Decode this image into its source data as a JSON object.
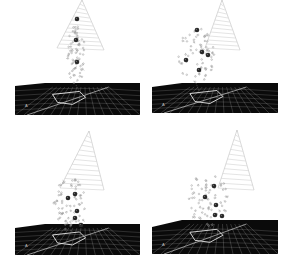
{
  "figure": {
    "layout": "2x2 grid",
    "panels": [
      {
        "id": "top-left",
        "ground": {
          "x": 15,
          "y": 83,
          "w": 125,
          "h": 32,
          "slant": 3
        },
        "cone": {
          "apexX": 82,
          "apexY": 0,
          "baseLX": 57,
          "baseRX": 104,
          "baseY": 48,
          "rings": 12
        },
        "dark_spheres": [
          [
            77,
            19
          ],
          [
            76,
            40
          ],
          [
            77,
            62
          ]
        ],
        "cluster": {
          "cx": 76,
          "cy": 55,
          "rx": 9,
          "ry": 30
        },
        "label": "A"
      },
      {
        "id": "top-right",
        "ground": {
          "x": 152,
          "y": 83,
          "w": 126,
          "h": 30,
          "slant": 4
        },
        "cone": {
          "apexX": 222,
          "apexY": 0,
          "baseLX": 205,
          "baseRX": 240,
          "baseY": 48,
          "rings": 12
        },
        "dark_spheres": [
          [
            197,
            30
          ],
          [
            202,
            52
          ],
          [
            208,
            55
          ],
          [
            186,
            60
          ],
          [
            199,
            70
          ]
        ],
        "cluster": {
          "cx": 196,
          "cy": 55,
          "rx": 18,
          "ry": 28
        },
        "label": "A"
      },
      {
        "id": "bottom-left",
        "ground": {
          "x": 15,
          "y": 224,
          "w": 125,
          "h": 31,
          "slant": 4
        },
        "cone": {
          "apexX": 89,
          "apexY": 131,
          "baseLX": 60,
          "baseRX": 104,
          "baseY": 188,
          "rings": 12
        },
        "dark_spheres": [
          [
            68,
            198
          ],
          [
            75,
            194
          ],
          [
            77,
            211
          ],
          [
            75,
            218
          ],
          [
            81,
            225
          ]
        ],
        "cluster": {
          "cx": 70,
          "cy": 204,
          "rx": 17,
          "ry": 26
        },
        "label": "A"
      },
      {
        "id": "bottom-right",
        "ground": {
          "x": 152,
          "y": 220,
          "w": 126,
          "h": 34,
          "slant": 7
        },
        "cone": {
          "apexX": 237,
          "apexY": 130,
          "baseLX": 218,
          "baseRX": 254,
          "baseY": 188,
          "rings": 12
        },
        "dark_spheres": [
          [
            214,
            186
          ],
          [
            205,
            197
          ],
          [
            216,
            205
          ],
          [
            215,
            215
          ],
          [
            222,
            216
          ]
        ],
        "cluster": {
          "cx": 208,
          "cy": 198,
          "rx": 20,
          "ry": 28
        },
        "label": "A"
      }
    ],
    "colors": {
      "background": "#ffffff",
      "ground": "#0a0a0a",
      "grid": "#bdbdbd",
      "cone": "#c8c8c8",
      "atom": "#9a9a9a",
      "dark_sphere": "#2a2a2a",
      "ribbon": "#e6e6e6"
    }
  }
}
